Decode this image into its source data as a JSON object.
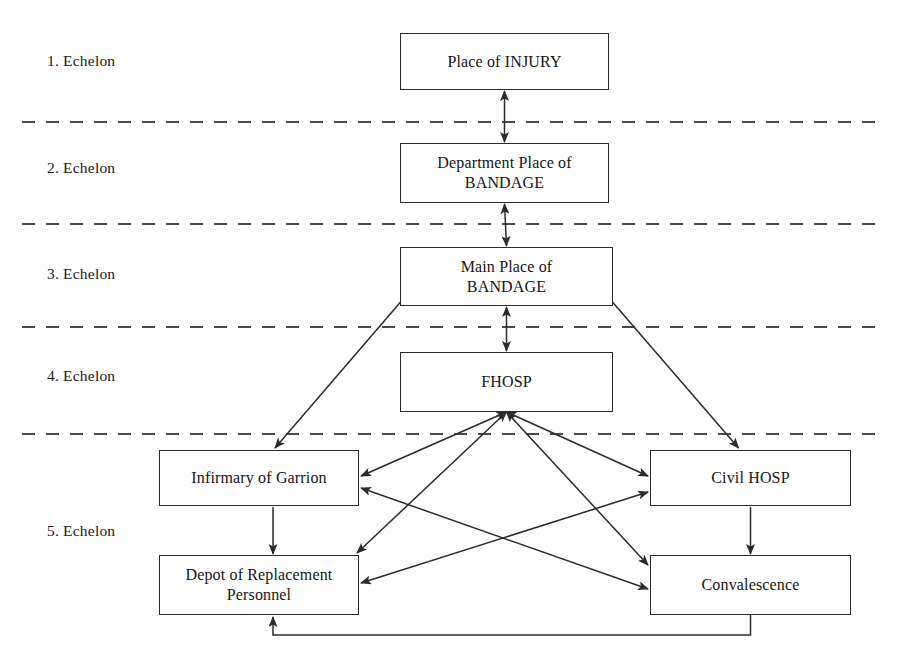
{
  "diagram": {
    "echelon_labels": [
      {
        "text": "1. Echelon",
        "x": 47,
        "y": 52
      },
      {
        "text": "2. Echelon",
        "x": 47,
        "y": 159
      },
      {
        "text": "3. Echelon",
        "x": 47,
        "y": 265
      },
      {
        "text": "4. Echelon",
        "x": 47,
        "y": 367
      },
      {
        "text": "5. Echelon",
        "x": 47,
        "y": 522
      }
    ],
    "nodes": [
      {
        "id": "injury",
        "label": "Place of INJURY",
        "x": 400,
        "y": 33,
        "w": 209,
        "h": 57
      },
      {
        "id": "dept_bandage",
        "label": "Department Place of\nBANDAGE",
        "x": 400,
        "y": 143,
        "w": 209,
        "h": 60
      },
      {
        "id": "main_bandage",
        "label": "Main Place of\nBANDAGE",
        "x": 400,
        "y": 247,
        "w": 213,
        "h": 59
      },
      {
        "id": "fhosp",
        "label": "FHOSP",
        "x": 400,
        "y": 352,
        "w": 213,
        "h": 60
      },
      {
        "id": "infirmary",
        "label": "Infirmary of Garrion",
        "x": 159,
        "y": 450,
        "w": 200,
        "h": 56
      },
      {
        "id": "civil_hosp",
        "label": "Civil HOSP",
        "x": 650,
        "y": 450,
        "w": 201,
        "h": 56
      },
      {
        "id": "depot",
        "label": "Depot of Replacement\nPersonnel",
        "x": 159,
        "y": 555,
        "w": 200,
        "h": 60
      },
      {
        "id": "convalescence",
        "label": "Convalescence",
        "x": 650,
        "y": 555,
        "w": 201,
        "h": 60
      }
    ],
    "divider_lines": [
      {
        "name": "divider-echelon-1-2",
        "y": 122,
        "x1": 22,
        "x2": 880
      },
      {
        "name": "divider-echelon-2-3",
        "y": 224,
        "x1": 22,
        "x2": 880
      },
      {
        "name": "divider-echelon-3-4",
        "y": 327,
        "x1": 22,
        "x2": 880
      },
      {
        "name": "divider-echelon-4-5",
        "y": 434,
        "x1": 22,
        "x2": 880
      }
    ],
    "edges": [
      {
        "name": "edge-injury-dept-bandage",
        "from": "injury",
        "to": "dept_bandage",
        "style": "double-arrow"
      },
      {
        "name": "edge-dept-bandage-main-bandage",
        "from": "dept_bandage",
        "to": "main_bandage",
        "style": "double-arrow"
      },
      {
        "name": "edge-main-bandage-fhosp",
        "from": "main_bandage",
        "to": "fhosp",
        "style": "double-arrow"
      },
      {
        "name": "edge-main-bandage-infirmary",
        "from": "main_bandage",
        "to": "infirmary",
        "style": "arrow"
      },
      {
        "name": "edge-main-bandage-civil-hosp",
        "from": "main_bandage",
        "to": "civil_hosp",
        "style": "arrow"
      },
      {
        "name": "edge-fhosp-infirmary",
        "from": "fhosp",
        "to": "infirmary",
        "style": "double-arrow"
      },
      {
        "name": "edge-fhosp-depot",
        "from": "fhosp",
        "to": "depot",
        "style": "double-arrow"
      },
      {
        "name": "edge-fhosp-civil-hosp",
        "from": "fhosp",
        "to": "civil_hosp",
        "style": "double-arrow"
      },
      {
        "name": "edge-fhosp-convalescence",
        "from": "fhosp",
        "to": "convalescence",
        "style": "double-arrow"
      },
      {
        "name": "edge-infirmary-depot",
        "from": "infirmary",
        "to": "depot",
        "style": "arrow"
      },
      {
        "name": "edge-civil-hosp-convalescence",
        "from": "civil_hosp",
        "to": "convalescence",
        "style": "arrow"
      },
      {
        "name": "edge-infirmary-convalescence",
        "from": "infirmary",
        "to": "convalescence",
        "style": "double-arrow"
      },
      {
        "name": "edge-civil-hosp-depot",
        "from": "civil_hosp",
        "to": "depot",
        "style": "double-arrow"
      },
      {
        "name": "edge-convalescence-depot-return",
        "from": "convalescence",
        "to": "depot",
        "style": "arrow-orthogonal"
      }
    ],
    "colors": {
      "stroke": "#2b2b2b",
      "text": "#141414",
      "background": "#ffffff",
      "divider": "#4a4a4a"
    }
  }
}
